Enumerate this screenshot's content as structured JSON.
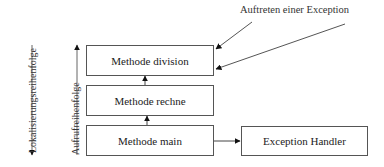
{
  "diagram": {
    "labels": {
      "localization_order": "Lokalisierungsreihenfolge",
      "call_order": "Aufrufreihenfolge",
      "exception_occurrence": "Auftreten einer Exception"
    },
    "boxes": {
      "division": "Methode division",
      "rechne": "Methode rechne",
      "main": "Methode main",
      "handler": "Exception Handler"
    },
    "colors": {
      "line": "#444444",
      "box_border": "#555555",
      "text": "#222222"
    }
  }
}
